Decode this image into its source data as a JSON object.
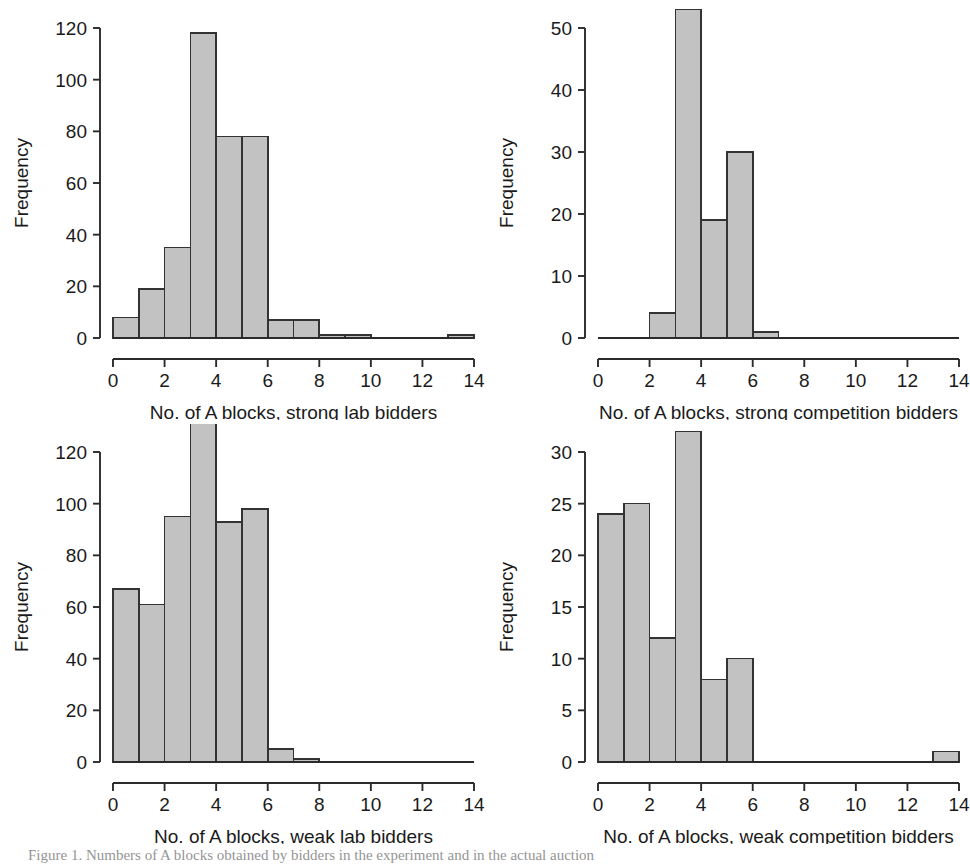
{
  "figure": {
    "background": "#ffffff",
    "bar_fill": "#c2c2c2",
    "bar_stroke": "#333333",
    "axis_color": "#2b2b2b",
    "caption_partial": "Figure 1.  Numbers of A blocks obtained by bidders in the experiment and in the actual auction"
  },
  "chart_data": [
    {
      "type": "bar",
      "panel": "top-left",
      "title": "",
      "xlabel": "No. of A blocks, strong lab bidders",
      "ylabel": "Frequency",
      "xlim": [
        0,
        14
      ],
      "ylim": [
        0,
        120
      ],
      "xticks": [
        0,
        2,
        4,
        6,
        8,
        10,
        12,
        14
      ],
      "yticks": [
        0,
        20,
        40,
        60,
        80,
        100,
        120
      ],
      "grid": false,
      "bin_width": 1,
      "bin_starts": [
        0,
        1,
        2,
        3,
        4,
        5,
        6,
        7,
        8,
        9,
        10,
        11,
        12,
        13
      ],
      "categories": [
        "0-1",
        "1-2",
        "2-3",
        "3-4",
        "4-5",
        "5-6",
        "6-7",
        "7-8",
        "8-9",
        "9-10",
        "10-11",
        "11-12",
        "12-13",
        "13-14"
      ],
      "values": [
        8,
        19,
        35,
        118,
        78,
        78,
        7,
        7,
        1,
        1,
        0,
        0,
        0,
        1
      ]
    },
    {
      "type": "bar",
      "panel": "top-right",
      "title": "",
      "xlabel": "No. of A blocks, strong competition bidders",
      "ylabel": "Frequency",
      "xlim": [
        0,
        14
      ],
      "ylim": [
        0,
        53
      ],
      "xticks": [
        0,
        2,
        4,
        6,
        8,
        10,
        12,
        14
      ],
      "yticks": [
        0,
        10,
        20,
        30,
        40,
        50
      ],
      "grid": false,
      "bin_width": 1,
      "bin_starts": [
        0,
        1,
        2,
        3,
        4,
        5,
        6,
        7,
        8,
        9,
        10,
        11,
        12,
        13
      ],
      "categories": [
        "0-1",
        "1-2",
        "2-3",
        "3-4",
        "4-5",
        "5-6",
        "6-7",
        "7-8",
        "8-9",
        "9-10",
        "10-11",
        "11-12",
        "12-13",
        "13-14"
      ],
      "values": [
        0,
        0,
        4,
        53,
        19,
        30,
        1,
        0,
        0,
        0,
        0,
        0,
        0,
        0
      ]
    },
    {
      "type": "bar",
      "panel": "bottom-left",
      "title": "",
      "xlabel": "No. of A blocks, weak lab bidders",
      "ylabel": "Frequency",
      "xlim": [
        0,
        14
      ],
      "ylim": [
        0,
        133
      ],
      "xticks": [
        0,
        2,
        4,
        6,
        8,
        10,
        12,
        14
      ],
      "yticks": [
        0,
        20,
        40,
        60,
        80,
        100,
        120
      ],
      "grid": false,
      "bin_width": 1,
      "bin_starts": [
        0,
        1,
        2,
        3,
        4,
        5,
        6,
        7,
        8,
        9,
        10,
        11,
        12,
        13
      ],
      "categories": [
        "0-1",
        "1-2",
        "2-3",
        "3-4",
        "4-5",
        "5-6",
        "6-7",
        "7-8",
        "8-9",
        "9-10",
        "10-11",
        "11-12",
        "12-13",
        "13-14"
      ],
      "values": [
        67,
        61,
        95,
        133,
        93,
        98,
        5,
        1,
        0,
        0,
        0,
        0,
        0,
        0
      ]
    },
    {
      "type": "bar",
      "panel": "bottom-right",
      "title": "",
      "xlabel": "No. of A blocks, weak competition bidders",
      "ylabel": "Frequency",
      "xlim": [
        0,
        14
      ],
      "ylim": [
        0,
        32
      ],
      "xticks": [
        0,
        2,
        4,
        6,
        8,
        10,
        12,
        14
      ],
      "yticks": [
        0,
        5,
        10,
        15,
        20,
        25,
        30
      ],
      "grid": false,
      "bin_width": 1,
      "bin_starts": [
        0,
        1,
        2,
        3,
        4,
        5,
        6,
        7,
        8,
        9,
        10,
        11,
        12,
        13
      ],
      "categories": [
        "0-1",
        "1-2",
        "2-3",
        "3-4",
        "4-5",
        "5-6",
        "6-7",
        "7-8",
        "8-9",
        "9-10",
        "10-11",
        "11-12",
        "12-13",
        "13-14"
      ],
      "values": [
        24,
        25,
        12,
        32,
        8,
        10,
        0,
        0,
        0,
        0,
        0,
        0,
        0,
        1
      ]
    }
  ]
}
